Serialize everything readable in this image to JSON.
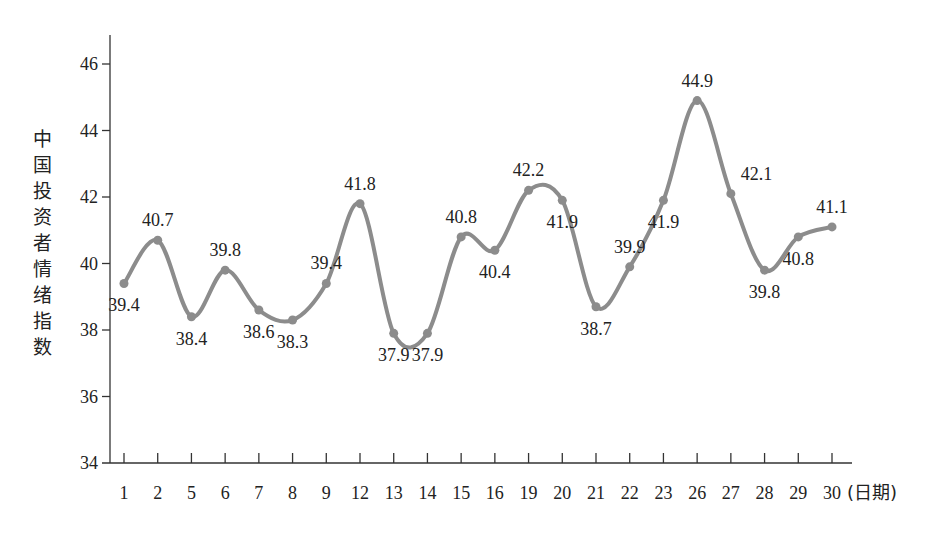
{
  "chart_data": {
    "type": "line",
    "title": "",
    "xlabel": "(日期)",
    "ylabel": "中国投资者情绪指数",
    "categories": [
      "1",
      "2",
      "5",
      "6",
      "7",
      "8",
      "9",
      "12",
      "13",
      "14",
      "15",
      "16",
      "19",
      "20",
      "21",
      "22",
      "23",
      "26",
      "27",
      "28",
      "29",
      "30"
    ],
    "series": [
      {
        "name": "中国投资者情绪指数",
        "values": [
          39.4,
          40.7,
          38.4,
          39.8,
          38.6,
          38.3,
          39.4,
          41.8,
          37.9,
          37.9,
          40.8,
          40.4,
          42.2,
          41.9,
          38.7,
          39.9,
          41.9,
          44.9,
          42.1,
          39.8,
          40.8,
          41.1
        ]
      }
    ],
    "label_positions": [
      "below",
      "above",
      "below",
      "above",
      "below",
      "below",
      "above",
      "above",
      "below",
      "below",
      "above",
      "below",
      "above",
      "below",
      "below",
      "above",
      "below",
      "above",
      "right",
      "below",
      "below",
      "above"
    ],
    "yticks": [
      34,
      36,
      38,
      40,
      42,
      44,
      46
    ],
    "ylim": [
      34,
      47
    ],
    "grid": false,
    "legend": "none",
    "line_color": "#8c8c8c",
    "marker": "circle",
    "smooth": true
  }
}
